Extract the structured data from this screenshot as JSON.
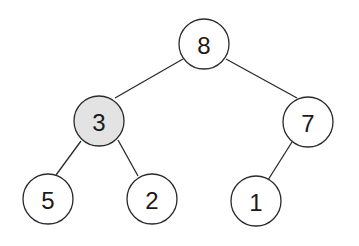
{
  "diagram": {
    "type": "binary-tree",
    "highlight_color": "#e3e3e3",
    "node_fill": "#ffffff",
    "nodes": [
      {
        "id": "n8",
        "label": "8",
        "x": 204,
        "y": 44,
        "highlighted": false
      },
      {
        "id": "n3",
        "label": "3",
        "x": 99,
        "y": 121,
        "highlighted": true
      },
      {
        "id": "n7",
        "label": "7",
        "x": 308,
        "y": 122,
        "highlighted": false
      },
      {
        "id": "n5",
        "label": "5",
        "x": 48,
        "y": 199,
        "highlighted": false
      },
      {
        "id": "n2",
        "label": "2",
        "x": 152,
        "y": 199,
        "highlighted": false
      },
      {
        "id": "n1",
        "label": "1",
        "x": 256,
        "y": 201,
        "highlighted": false
      }
    ],
    "edges": [
      {
        "from": "8",
        "to": "3"
      },
      {
        "from": "8",
        "to": "7"
      },
      {
        "from": "3",
        "to": "5"
      },
      {
        "from": "3",
        "to": "2"
      },
      {
        "from": "7",
        "to": "1"
      }
    ]
  }
}
